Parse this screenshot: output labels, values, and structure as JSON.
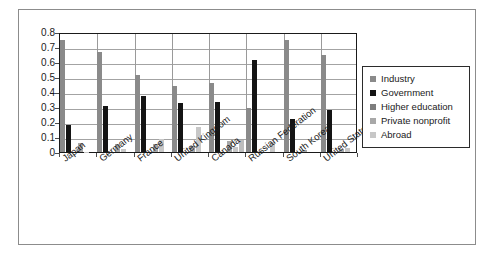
{
  "chart_data": {
    "type": "bar",
    "title": "",
    "subtitle": "",
    "xlabel": "",
    "ylabel": "",
    "ylim": [
      0,
      0.8
    ],
    "ytick_labels": [
      "0.8",
      "0.7",
      "0.6",
      "0.5",
      "0.4",
      "0.3",
      "0.2",
      "0.1",
      "0"
    ],
    "ytick_values": [
      0.8,
      0.7,
      0.6,
      0.5,
      0.4,
      0.3,
      0.2,
      0.1,
      0
    ],
    "grid": true,
    "legend_position": "right",
    "categories": [
      "Japan",
      "Germany",
      "France",
      "United Kingdom",
      "Canada",
      "Russian Federation",
      "South Korea",
      "United States"
    ],
    "series": [
      {
        "name": "Industry",
        "color": "#8a8a8a",
        "values": [
          0.75,
          0.67,
          0.515,
          0.44,
          0.46,
          0.295,
          0.745,
          0.65
        ]
      },
      {
        "name": "Government",
        "color": "#141414",
        "values": [
          0.18,
          0.305,
          0.375,
          0.325,
          0.335,
          0.615,
          0.22,
          0.28
        ]
      },
      {
        "name": "Higher education",
        "color": "#7d7d7d",
        "values": [
          0.0,
          0.0,
          0.0,
          0.0,
          0.0,
          0.0,
          0.0,
          0.0
        ]
      },
      {
        "name": "Private nonprofit",
        "color": "#a8a8a8",
        "values": [
          0.057,
          0.055,
          0.052,
          0.043,
          0.075,
          0.0,
          0.015,
          0.02
        ]
      },
      {
        "name": "Abroad",
        "color": "#c7c7c7",
        "values": [
          0.003,
          0.02,
          0.085,
          0.17,
          0.033,
          0.068,
          0.0,
          0.025
        ]
      }
    ],
    "extra_bars": {
      "note": "sixth slim light bar visible in some groups",
      "values": [
        0.0,
        0.0,
        0.0,
        0.0,
        0.077,
        0.0,
        0.0,
        0.0
      ]
    }
  },
  "legend": {
    "items": [
      {
        "label": "Industry",
        "color": "#8a8a8a"
      },
      {
        "label": "Government",
        "color": "#141414"
      },
      {
        "label": "Higher education",
        "color": "#7d7d7d"
      },
      {
        "label": "Private nonprofit",
        "color": "#a8a8a8"
      },
      {
        "label": "Abroad",
        "color": "#c7c7c7"
      }
    ]
  },
  "colors": {
    "axis": "#1a1a1a",
    "gridline": "#a3a3a3",
    "frame": "#8c8c8c",
    "background": "#ffffff"
  }
}
